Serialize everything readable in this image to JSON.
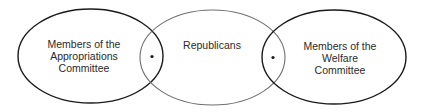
{
  "diagram": {
    "type": "venn",
    "sets": [
      {
        "id": "appropriations",
        "lines": [
          "Members of the",
          "Appropriations",
          "Committee"
        ]
      },
      {
        "id": "republicans",
        "lines": [
          "Republicans"
        ]
      },
      {
        "id": "welfare",
        "lines": [
          "Members of the",
          "Welfare",
          "Committee"
        ]
      }
    ],
    "intersections": [
      {
        "between": [
          "appropriations",
          "republicans"
        ],
        "marker": "dot"
      },
      {
        "between": [
          "republicans",
          "welfare"
        ],
        "marker": "dot"
      }
    ],
    "colors": {
      "outer_stroke": "#1a1a1a",
      "center_stroke": "#6e6e6e",
      "text": "#2a2a2a",
      "background": "#ffffff"
    }
  }
}
